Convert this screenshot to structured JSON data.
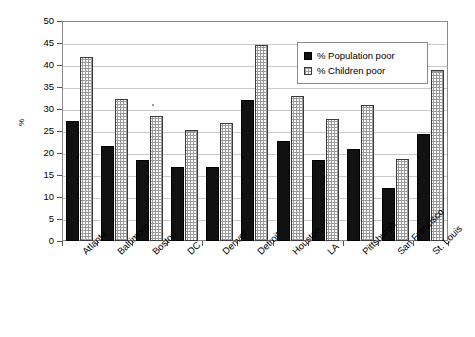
{
  "chart_data": {
    "type": "bar",
    "title": "",
    "xlabel": "",
    "ylabel": "%",
    "ylim": [
      0,
      50
    ],
    "ytick_step": 5,
    "yticks": [
      "50",
      "45",
      "40",
      "35",
      "30",
      "25",
      "20",
      "15",
      "10",
      "5",
      "0"
    ],
    "grid": true,
    "legend_position": "top-right",
    "categories": [
      "Atlanta",
      "Baltimore",
      "Boston",
      "DC",
      "Denver",
      "Detroit",
      "Houston",
      "LA",
      "Pittsburgh",
      "San Francisco",
      "St. Louis"
    ],
    "series": [
      {
        "name": "% Population poor",
        "color": "#111111",
        "values": [
          27.3,
          21.7,
          18.5,
          16.9,
          16.9,
          32.0,
          22.8,
          18.3,
          20.8,
          12.0,
          24.4
        ]
      },
      {
        "name": "% Children poor",
        "color": "#fdfdfd",
        "values": [
          41.8,
          32.3,
          28.3,
          25.2,
          26.9,
          44.6,
          33.0,
          27.7,
          31.0,
          18.6,
          38.8
        ]
      }
    ]
  },
  "legend": {
    "items": [
      {
        "label": "% Population poor",
        "swatch": "filled-black-square"
      },
      {
        "label": "% Children poor",
        "swatch": "dotted-white-square"
      }
    ]
  },
  "axis": {
    "y_title": "%"
  }
}
